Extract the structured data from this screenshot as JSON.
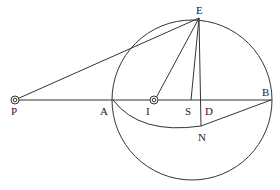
{
  "diagram": {
    "type": "geometry-figure",
    "stroke_color": "#333333",
    "background": "#ffffff",
    "points": {
      "P": {
        "label": "P",
        "x": 15,
        "y": 100,
        "marker": "double-circle"
      },
      "A": {
        "label": "A",
        "x": 113,
        "y": 100
      },
      "I": {
        "label": "I",
        "x": 154,
        "y": 100,
        "marker": "double-circle"
      },
      "S": {
        "label": "S",
        "x": 191,
        "y": 100
      },
      "D": {
        "label": "D",
        "x": 201,
        "y": 100
      },
      "B": {
        "label": "B",
        "x": 271,
        "y": 100
      },
      "E": {
        "label": "E",
        "x": 199,
        "y": 18
      },
      "N": {
        "label": "N",
        "x": 201,
        "y": 126
      }
    },
    "circle": {
      "cx": 192,
      "cy": 100,
      "r": 80
    },
    "segments": [
      [
        "P",
        "B"
      ],
      [
        "E",
        "P"
      ],
      [
        "E",
        "I"
      ],
      [
        "E",
        "S"
      ],
      [
        "E",
        "N"
      ],
      [
        "N",
        "B"
      ]
    ],
    "arcs": [
      {
        "name": "A-N arc",
        "from": "A",
        "through": "N"
      }
    ]
  }
}
